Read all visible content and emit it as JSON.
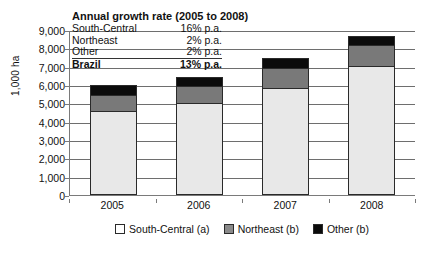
{
  "chart_data": {
    "type": "bar",
    "stacked": true,
    "title": "",
    "xlabel": "",
    "ylabel": "1,000 ha",
    "ylim": [
      0,
      9000
    ],
    "ytick_step": 1000,
    "yticks": [
      "9,000",
      "8,000",
      "7,000",
      "6,000",
      "5,000",
      "4,000",
      "3,000",
      "2,000",
      "1,000",
      "0"
    ],
    "grid": true,
    "categories": [
      "2005",
      "2006",
      "2007",
      "2008"
    ],
    "legend_position": "bottom",
    "series": [
      {
        "name": "South-Central (a)",
        "color": "#e8e8e8",
        "values": [
          4600,
          5000,
          5850,
          7050
        ]
      },
      {
        "name": "Northeast (b)",
        "color": "#797979",
        "values": [
          850,
          950,
          1100,
          1150
        ]
      },
      {
        "name": "Other (b)",
        "color": "#0b0b0b",
        "values": [
          550,
          500,
          500,
          500
        ]
      }
    ],
    "totals": [
      6000,
      6450,
      7450,
      8700
    ],
    "annotation": {
      "title": "Annual growth rate (2005 to 2008)",
      "rows": [
        {
          "label": "South-Central",
          "value": "16% p.a."
        },
        {
          "label": "Northeast",
          "value": "2% p.a."
        },
        {
          "label": "Other",
          "value": "2% p.a."
        }
      ],
      "total_row": {
        "label": "Brazil",
        "value": "13% p.a."
      }
    }
  }
}
